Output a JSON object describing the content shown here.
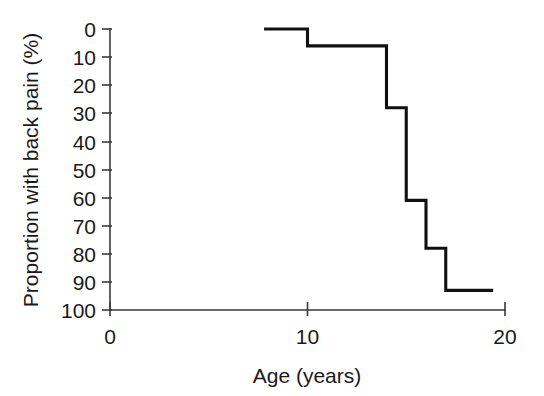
{
  "chart_data": {
    "type": "line",
    "subtype": "step",
    "title": "",
    "xlabel": "Age (years)",
    "ylabel": "Proportion with back pain (%)",
    "xlim": [
      0,
      20
    ],
    "ylim": [
      0,
      100
    ],
    "y_axis_inverted": true,
    "grid": false,
    "legend": null,
    "xticks": [
      0,
      10,
      20
    ],
    "xtick_labels": [
      "0",
      "10",
      "20"
    ],
    "yticks": [
      0,
      10,
      20,
      30,
      40,
      50,
      60,
      70,
      80,
      90,
      100
    ],
    "ytick_labels": [
      "0",
      "10",
      "20",
      "30",
      "40",
      "50",
      "60",
      "70",
      "80",
      "90",
      "100"
    ],
    "series": [
      {
        "name": "Proportion with back pain",
        "color": "#111111",
        "x": [
          7.8,
          10,
          10,
          14,
          14,
          15,
          15,
          16,
          16,
          17,
          17,
          19.4
        ],
        "y": [
          0,
          0,
          6,
          6,
          28,
          28,
          61,
          61,
          78,
          78,
          93,
          93
        ]
      }
    ],
    "steps": [
      {
        "age": 7.8,
        "proportion": 0
      },
      {
        "age": 10,
        "proportion": 6
      },
      {
        "age": 14,
        "proportion": 28
      },
      {
        "age": 15,
        "proportion": 61
      },
      {
        "age": 16,
        "proportion": 78
      },
      {
        "age": 17,
        "proportion": 93
      },
      {
        "age": 19.4,
        "proportion": 93
      }
    ],
    "axis_color": "#3a3a3a",
    "line_color": "#111111",
    "background": "#ffffff"
  }
}
